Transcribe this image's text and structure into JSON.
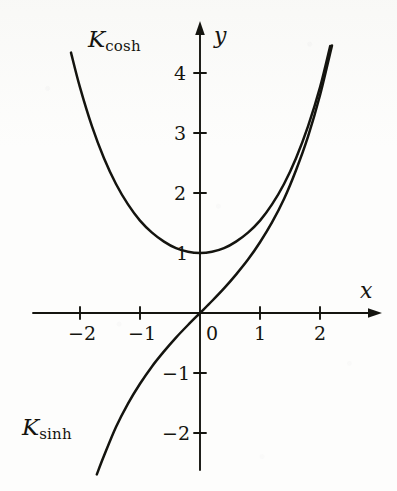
{
  "figure": {
    "background_color": "#fdfdfc",
    "ink_color": "#14140f"
  },
  "chart_data": {
    "type": "line",
    "title": "",
    "xlabel": "x",
    "ylabel": "y",
    "xlim": [
      -2.45,
      2.95
    ],
    "ylim": [
      -2.9,
      4.85
    ],
    "xticks": [
      -2,
      -1,
      0,
      1,
      2
    ],
    "yticks": [
      -2,
      -1,
      1,
      2,
      3,
      4
    ],
    "xtick_labels": [
      "−2",
      "−1",
      "0",
      "1",
      "2"
    ],
    "ytick_labels": [
      "−2",
      "−1",
      "1",
      "2",
      "3",
      "4"
    ],
    "grid": false,
    "legend": "inline-annotations",
    "axes_style": "arrow-tipped cartesian axes through origin",
    "series": [
      {
        "name": "K_cosh",
        "label_base": "K",
        "label_sub": "cosh",
        "formula": "y = cosh(x)",
        "color": "#14140f",
        "x_range": [
          -2.15,
          2.17
        ],
        "annotation_position": {
          "x": -1.85,
          "y": 4.35
        },
        "points": [
          {
            "x": -2.15,
            "y": 4.34
          },
          {
            "x": -2.0,
            "y": 3.76
          },
          {
            "x": -1.8,
            "y": 3.11
          },
          {
            "x": -1.6,
            "y": 2.58
          },
          {
            "x": -1.4,
            "y": 2.15
          },
          {
            "x": -1.2,
            "y": 1.81
          },
          {
            "x": -1.0,
            "y": 1.54
          },
          {
            "x": -0.8,
            "y": 1.34
          },
          {
            "x": -0.6,
            "y": 1.19
          },
          {
            "x": -0.4,
            "y": 1.08
          },
          {
            "x": -0.2,
            "y": 1.02
          },
          {
            "x": 0.0,
            "y": 1.0
          },
          {
            "x": 0.2,
            "y": 1.02
          },
          {
            "x": 0.4,
            "y": 1.08
          },
          {
            "x": 0.6,
            "y": 1.19
          },
          {
            "x": 0.8,
            "y": 1.34
          },
          {
            "x": 1.0,
            "y": 1.54
          },
          {
            "x": 1.2,
            "y": 1.81
          },
          {
            "x": 1.4,
            "y": 2.15
          },
          {
            "x": 1.6,
            "y": 2.58
          },
          {
            "x": 1.8,
            "y": 3.11
          },
          {
            "x": 2.0,
            "y": 3.76
          },
          {
            "x": 2.17,
            "y": 4.45
          }
        ]
      },
      {
        "name": "K_sinh",
        "label_base": "K",
        "label_sub": "sinh",
        "formula": "y = sinh(x)",
        "color": "#14140f",
        "x_range": [
          -1.72,
          2.2
        ],
        "annotation_position": {
          "x": -2.2,
          "y": -1.95
        },
        "points": [
          {
            "x": -1.72,
            "y": -2.69
          },
          {
            "x": -1.6,
            "y": -2.38
          },
          {
            "x": -1.4,
            "y": -1.9
          },
          {
            "x": -1.2,
            "y": -1.51
          },
          {
            "x": -1.0,
            "y": -1.18
          },
          {
            "x": -0.8,
            "y": -0.89
          },
          {
            "x": -0.6,
            "y": -0.64
          },
          {
            "x": -0.4,
            "y": -0.41
          },
          {
            "x": -0.2,
            "y": -0.2
          },
          {
            "x": 0.0,
            "y": 0.0
          },
          {
            "x": 0.2,
            "y": 0.2
          },
          {
            "x": 0.4,
            "y": 0.41
          },
          {
            "x": 0.6,
            "y": 0.64
          },
          {
            "x": 0.8,
            "y": 0.89
          },
          {
            "x": 1.0,
            "y": 1.18
          },
          {
            "x": 1.2,
            "y": 1.51
          },
          {
            "x": 1.4,
            "y": 1.9
          },
          {
            "x": 1.6,
            "y": 2.38
          },
          {
            "x": 1.8,
            "y": 2.94
          },
          {
            "x": 2.0,
            "y": 3.63
          },
          {
            "x": 2.2,
            "y": 4.46
          }
        ]
      }
    ]
  },
  "axes": {
    "x_axis_label": "x",
    "y_axis_label": "y"
  },
  "labels": {
    "cosh_base": "K",
    "cosh_sub": "cosh",
    "sinh_base": "K",
    "sinh_sub": "sinh"
  },
  "ticks": {
    "x_neg2": "−2",
    "x_neg1": "−1",
    "x_0": "0",
    "x_1": "1",
    "x_2": "2",
    "y_4": "4",
    "y_3": "3",
    "y_2": "2",
    "y_1": "1",
    "y_neg1": "−1",
    "y_neg2": "−2"
  }
}
